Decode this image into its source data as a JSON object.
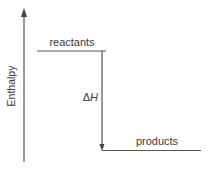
{
  "diagram": {
    "type": "enthalpy-level-diagram",
    "axis_label": "Enthalpy",
    "levels": [
      {
        "id": "reactants",
        "label": "reactants",
        "relative_enthalpy": "high"
      },
      {
        "id": "products",
        "label": "products",
        "relative_enthalpy": "low"
      }
    ],
    "change_label_delta": "Δ",
    "change_label_symbol": "H",
    "change_direction": "down",
    "colors": {
      "line": "#555555",
      "text": "#3a3a3a"
    }
  }
}
